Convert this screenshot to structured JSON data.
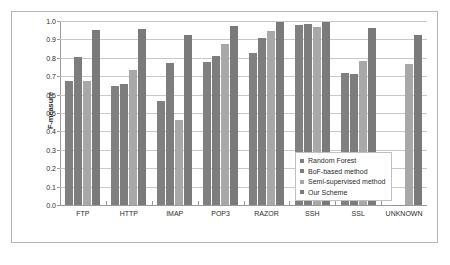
{
  "chart_data": {
    "type": "bar",
    "title": "",
    "xlabel": "",
    "ylabel": "F-measure",
    "ylim": [
      0.0,
      1.0
    ],
    "grid": true,
    "legend_position": "inside-lower-right",
    "categories": [
      "FTP",
      "HTTP",
      "IMAP",
      "POP3",
      "RAZOR",
      "SSH",
      "SSL",
      "UNKNOWN"
    ],
    "ytick_labels": [
      "1.0",
      "0.9",
      "0.8",
      "0.7",
      "0.6",
      "0.5",
      "0.4",
      "0.3",
      "0.2",
      "0.1",
      "0.0"
    ],
    "ytick_values": [
      1.0,
      0.9,
      0.8,
      0.7,
      0.6,
      0.5,
      0.4,
      0.3,
      0.2,
      0.1,
      0.0
    ],
    "series": [
      {
        "name": "Random Forest",
        "color": "#808080",
        "values": [
          0.675,
          0.645,
          0.565,
          0.775,
          0.825,
          0.98,
          0.72,
          null
        ]
      },
      {
        "name": "BoF-based method",
        "color": "#7d7d7d",
        "values": [
          0.805,
          0.655,
          0.77,
          0.81,
          0.91,
          0.985,
          0.71,
          null
        ]
      },
      {
        "name": "Semi-supervised method",
        "color": "#a8a8a8",
        "values": [
          0.675,
          0.735,
          0.46,
          0.875,
          0.945,
          0.965,
          0.78,
          0.765
        ]
      },
      {
        "name": "Our Scheme",
        "color": "#7a7a7a",
        "values": [
          0.95,
          0.955,
          0.925,
          0.975,
          0.995,
          0.995,
          0.96,
          0.925
        ]
      }
    ]
  }
}
